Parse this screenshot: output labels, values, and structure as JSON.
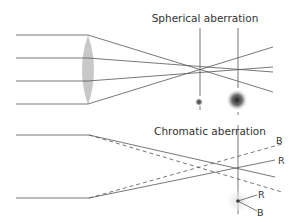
{
  "diagram": {
    "top": {
      "title": "Spherical aberration",
      "description": "Parallel rays through convex lens; marginal rays focus closer than paraxial rays",
      "spots": [
        "small focused spot",
        "large blurred spot"
      ]
    },
    "bottom": {
      "title": "Chromatic aberration",
      "ray_labels": [
        "B",
        "R"
      ],
      "spot_labels": [
        "R",
        "B"
      ],
      "legend": {
        "solid": "R (red light)",
        "dashed": "B (blue light)"
      }
    }
  },
  "colors": {
    "ray": "#555555",
    "lens": "#c8c8c8",
    "text": "#333333"
  }
}
